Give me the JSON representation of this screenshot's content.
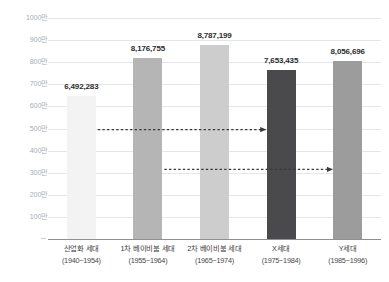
{
  "chart_data": {
    "type": "bar",
    "title": "",
    "subtitle": "",
    "xlabel": "",
    "ylabel": "",
    "grid": true,
    "legend": "none",
    "ylim": [
      0,
      10000000
    ],
    "ytick_values": [
      1000000,
      2000000,
      3000000,
      4000000,
      5000000,
      6000000,
      7000000,
      8000000,
      9000000,
      10000000
    ],
    "ytick_labels": [
      "100만",
      "200만",
      "300만",
      "400만",
      "500만",
      "600만",
      "700만",
      "800만",
      "900만",
      "1000만"
    ],
    "categories": [
      "산업화 세대",
      "1차 베이비붐 세대",
      "2차 베이비붐 세대",
      "X세대",
      "Y세대"
    ],
    "category_sublabels": [
      "(1940~1954)",
      "(1955~1964)",
      "(1965~1974)",
      "(1975~1984)",
      "(1985~1996)"
    ],
    "values": [
      6492283,
      8176755,
      8787199,
      7653435,
      8056696
    ],
    "value_labels": [
      "6,492,283",
      "8,176,755",
      "8,787,199",
      "7,653,435",
      "8,056,696"
    ],
    "bar_colors": [
      "#f3f3f3",
      "#b5b5b5",
      "#cdcdcd",
      "#4a4a4d",
      "#9c9c9c"
    ],
    "annotations": [
      {
        "name": "arrow-industrial-to-x",
        "style": "dashed-arrow",
        "from_category": "산업화 세대",
        "to_category": "X세대",
        "color": "#3a3a3a"
      },
      {
        "name": "arrow-boomer1-to-y",
        "style": "dashed-arrow",
        "from_category": "1차 베이비붐 세대",
        "to_category": "Y세대",
        "color": "#3a3a3a"
      }
    ],
    "axis_colors": {
      "gridline": "#e3e6ea",
      "baseline": "#8d9196",
      "ytick_text": "#a9aeb4",
      "xtick_text": "#3c3c3c",
      "value_text": "#2d2d2d"
    }
  }
}
